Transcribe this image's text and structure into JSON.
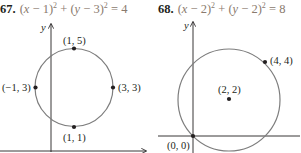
{
  "problems": [
    {
      "number": "67.",
      "equation_parts": [
        "(",
        "x",
        " − 1)",
        "2",
        " + (",
        "y",
        " − 3)",
        "2",
        " = 4"
      ],
      "equation": "(x − 1)^2 + (y − 3)^2 = 4",
      "axis_label_y": "y",
      "points": [
        {
          "label": "(1, 5)"
        },
        {
          "label": "(−1, 3)"
        },
        {
          "label": "(3, 3)"
        },
        {
          "label": "(1, 1)"
        }
      ]
    },
    {
      "number": "68.",
      "equation_parts": [
        "(",
        "x",
        " − 2)",
        "2",
        " + (",
        "y",
        " − 2)",
        "2",
        " = 8"
      ],
      "equation": "(x − 2)^2 + (y − 2)^2 = 8",
      "axis_label_y": "y",
      "points": [
        {
          "label": "(4, 4)"
        },
        {
          "label": "(2, 2)"
        },
        {
          "label": "(0, 0)"
        }
      ]
    }
  ],
  "colors": {
    "circle": "#7d7d7d",
    "axes": "#231f20",
    "equation": "#8a7a6e"
  }
}
